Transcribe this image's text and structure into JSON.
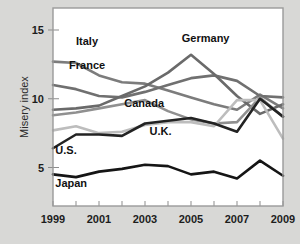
{
  "chart_data": {
    "type": "line",
    "title": "",
    "subtitle": "",
    "xlabel": "",
    "ylabel": "Misery index",
    "xlim": [
      1999,
      2009
    ],
    "ylim": [
      2.2,
      16.6
    ],
    "grid": false,
    "legend": "inline-labels",
    "x": [
      1999,
      2000,
      2001,
      2002,
      2003,
      2004,
      2005,
      2006,
      2007,
      2008,
      2009
    ],
    "xticks": [
      1999,
      2000,
      2001,
      2002,
      2003,
      2004,
      2005,
      2006,
      2007,
      2008,
      2009
    ],
    "xtick_labels": [
      "1999",
      "",
      "2001",
      "",
      "2003",
      "",
      "2005",
      "",
      "2007",
      "",
      "2009"
    ],
    "xtick_labels_shown": [
      "1999",
      "2001",
      "2003",
      "2005",
      "2007",
      "2009"
    ],
    "yticks": [
      5,
      10,
      15
    ],
    "ytick_labels": [
      "5",
      "10",
      "15"
    ],
    "series": [
      {
        "name": "Italy",
        "color": "#7c7c7c",
        "label_x": 2000.0,
        "label_y": 13.9,
        "values": [
          12.7,
          12.6,
          11.7,
          11.2,
          11.1,
          10.6,
          10.1,
          9.6,
          9.2,
          10.3,
          9.3
        ]
      },
      {
        "name": "France",
        "color": "#707070",
        "label_x": 1999.7,
        "label_y": 12.2,
        "values": [
          11.0,
          10.7,
          10.2,
          10.1,
          10.5,
          11.0,
          11.5,
          11.7,
          11.3,
          10.2,
          10.1
        ]
      },
      {
        "name": "Germany",
        "color": "#6a6a6a",
        "label_x": 2004.6,
        "label_y": 14.1,
        "values": [
          9.2,
          9.3,
          9.5,
          10.2,
          10.9,
          11.9,
          13.2,
          11.8,
          10.2,
          8.9,
          9.6
        ]
      },
      {
        "name": "Canada",
        "color": "#909090",
        "label_x": 2002.1,
        "label_y": 9.4,
        "values": [
          8.8,
          9.0,
          9.3,
          9.6,
          9.9,
          9.1,
          8.5,
          8.2,
          8.3,
          10.1,
          8.7
        ]
      },
      {
        "name": "U.K.",
        "color": "#bdbdbd",
        "label_x": 2003.2,
        "label_y": 7.4,
        "values": [
          7.7,
          8.0,
          7.5,
          7.6,
          8.1,
          8.3,
          8.3,
          8.0,
          9.9,
          9.9,
          7.1
        ]
      },
      {
        "name": "U.S.",
        "color": "#232323",
        "label_x": 1999.1,
        "label_y": 6.0,
        "values": [
          6.4,
          7.4,
          7.4,
          7.3,
          8.2,
          8.4,
          8.6,
          8.2,
          7.6,
          10.0,
          8.7
        ]
      },
      {
        "name": "Japan",
        "color": "#151515",
        "label_x": 1999.1,
        "label_y": 3.6,
        "values": [
          4.5,
          4.3,
          4.7,
          4.9,
          5.2,
          5.1,
          4.5,
          4.7,
          4.2,
          5.5,
          4.4
        ]
      }
    ]
  }
}
